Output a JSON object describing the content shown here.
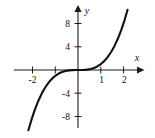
{
  "chart_data": {
    "type": "line",
    "title": "",
    "subtitle": "",
    "xlabel": "x",
    "ylabel": "y",
    "function": "y = x^3",
    "xlim": [
      -2.45,
      2.35
    ],
    "ylim": [
      -9.6,
      9.4
    ],
    "grid": false,
    "legend": null,
    "axis_arrows": true,
    "x_ticks": [
      -2,
      -1,
      1,
      2
    ],
    "x_tick_labels": [
      "-2",
      "",
      "1",
      "2"
    ],
    "y_ticks": [
      -8,
      -4,
      4,
      8
    ],
    "y_tick_labels": [
      "-8",
      "-4",
      "4",
      "8"
    ],
    "series": [
      {
        "name": "y = x^3",
        "color": "#111111",
        "x": [
          -2.18,
          -2.05,
          -1.9,
          -1.75,
          -1.6,
          -1.45,
          -1.3,
          -1.15,
          -1.0,
          -0.85,
          -0.7,
          -0.55,
          -0.4,
          -0.25,
          -0.1,
          0.0,
          0.1,
          0.25,
          0.4,
          0.55,
          0.7,
          0.85,
          1.0,
          1.15,
          1.3,
          1.45,
          1.6,
          1.75,
          1.9,
          2.05,
          2.18
        ],
        "y": [
          -10.36,
          -8.62,
          -6.86,
          -5.36,
          -4.1,
          -3.05,
          -2.2,
          -1.52,
          -1.0,
          -0.61,
          -0.34,
          -0.17,
          -0.06,
          -0.02,
          -0.001,
          0.0,
          0.001,
          0.02,
          0.06,
          0.17,
          0.34,
          0.61,
          1.0,
          1.52,
          2.2,
          3.05,
          4.1,
          5.36,
          6.86,
          8.62,
          10.36
        ]
      }
    ]
  },
  "labels": {
    "x_axis_name": "x",
    "y_axis_name": "y",
    "x_tick_neg2": "-2",
    "x_tick_1": "1",
    "x_tick_2": "2",
    "y_tick_8": "8",
    "y_tick_4": "4",
    "y_tick_neg4": "-4",
    "y_tick_neg8": "-8"
  }
}
